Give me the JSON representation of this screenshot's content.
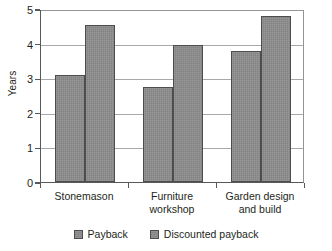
{
  "chart_data": {
    "type": "bar",
    "title": "",
    "subtitle": "",
    "xlabel": "",
    "ylabel": "Years",
    "ylim": [
      0,
      5
    ],
    "yticks": [
      0,
      1,
      2,
      3,
      4,
      5
    ],
    "ytick_labels": [
      "0",
      "1",
      "2",
      "3",
      "4",
      "5"
    ],
    "grid": true,
    "grid_axis": "y",
    "legend_position": "bottom",
    "categories": [
      "Stonemason",
      "Furniture\nworkshop",
      "Garden design\nand build"
    ],
    "series": [
      {
        "name": "Payback",
        "values": [
          3.1,
          2.75,
          3.8
        ],
        "color": "#8c8c8c",
        "edge_color": "#4d4d4d"
      },
      {
        "name": "Discounted payback",
        "values": [
          4.55,
          3.95,
          4.8
        ],
        "color": "#8c8c8c",
        "edge_color": "#4d4d4d"
      }
    ]
  },
  "legend": {
    "items": [
      {
        "label": "Payback"
      },
      {
        "label": "Discounted payback"
      }
    ]
  },
  "axes": {
    "y_title": "Years"
  },
  "colors": {
    "bar_fill": "#8c8c8c",
    "bar_edge": "#4d4d4d",
    "gridline": "#a7a9ac",
    "axis": "#58595b",
    "text": "#231f20",
    "background": "#ffffff"
  }
}
